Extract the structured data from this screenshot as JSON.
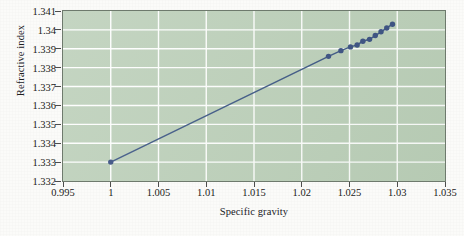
{
  "chart_data": {
    "type": "line",
    "title": "",
    "subtitle": "",
    "xlabel": "Specific gravity",
    "ylabel": "Refractive index",
    "xlim": [
      0.995,
      1.035
    ],
    "ylim": [
      1.332,
      1.341
    ],
    "xticks": [
      "0.995",
      "1",
      "1.005",
      "1.01",
      "1.015",
      "1.02",
      "1.025",
      "1.03",
      "1.035"
    ],
    "xtick_values": [
      0.995,
      1.0,
      1.005,
      1.01,
      1.015,
      1.02,
      1.025,
      1.03,
      1.035
    ],
    "yticks": [
      "1.332",
      "1.333",
      "1.334",
      "1.335",
      "1.336",
      "1.337",
      "1.338",
      "1.339",
      "1.34",
      "1.341"
    ],
    "ytick_values": [
      1.332,
      1.333,
      1.334,
      1.335,
      1.336,
      1.337,
      1.338,
      1.339,
      1.34,
      1.341
    ],
    "grid": true,
    "legend": null,
    "legend_position": "none",
    "marker": "filled-circle",
    "series": [
      {
        "name": "Refractive index vs specific gravity",
        "x": [
          1.0,
          1.0228,
          1.0241,
          1.0251,
          1.0258,
          1.0264,
          1.0271,
          1.0277,
          1.0283,
          1.0289,
          1.0295
        ],
        "y": [
          1.333,
          1.3386,
          1.3389,
          1.3391,
          1.3392,
          1.3394,
          1.3395,
          1.3397,
          1.3399,
          1.3401,
          1.3403
        ]
      }
    ],
    "colors": {
      "line": "#2f4a7c",
      "marker": "#2b4279",
      "plot_background": "#b9cdb6",
      "gridline": "#ffffff",
      "axis_border": "#6e7a6d",
      "page_background": "#fbfbf9",
      "text": "#1b1b1a"
    }
  }
}
